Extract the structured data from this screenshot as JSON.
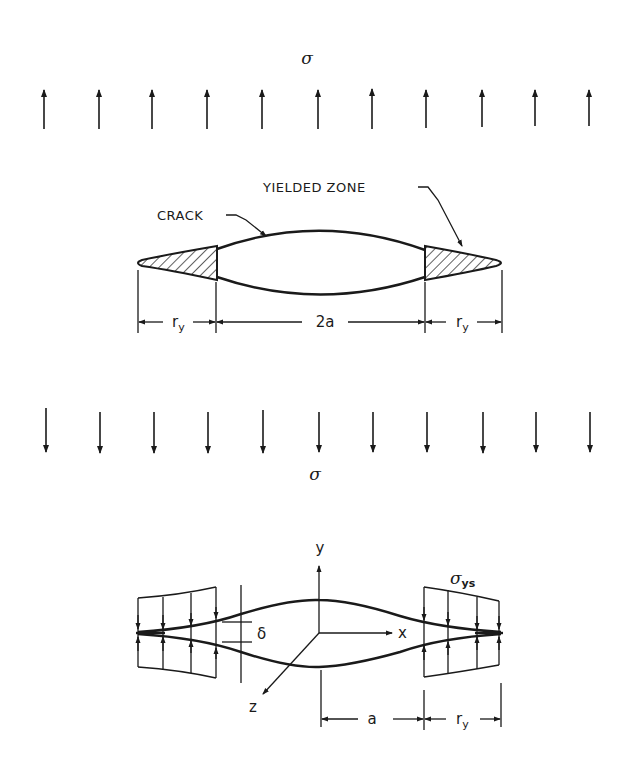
{
  "figure": {
    "top_panel": {
      "applied_stress_top_label": "σ",
      "applied_stress_bottom_label": "σ",
      "up_arrow_count": 11,
      "down_arrow_count": 11,
      "crack_label": "CRACK",
      "yielded_zone_label": "YIELDED ZONE",
      "dimensions": {
        "left_plastic_zone": {
          "main": "r",
          "sub": "y"
        },
        "crack_length": "2a",
        "right_plastic_zone": {
          "main": "r",
          "sub": "y"
        }
      }
    },
    "bottom_panel": {
      "axis_x_label": "x",
      "axis_y_label": "y",
      "axis_z_label": "z",
      "opening_label": "δ",
      "yield_stress_label": {
        "main": "σ",
        "sub": "ys"
      },
      "dimensions": {
        "half_crack_length": "a",
        "plastic_zone": {
          "main": "r",
          "sub": "y"
        }
      }
    }
  },
  "arrow_x_positions": [
    44,
    99,
    152,
    207,
    262,
    318,
    372,
    426,
    482,
    535,
    589
  ],
  "colors": {
    "ink": "#1a1a1a",
    "background": "#ffffff"
  }
}
